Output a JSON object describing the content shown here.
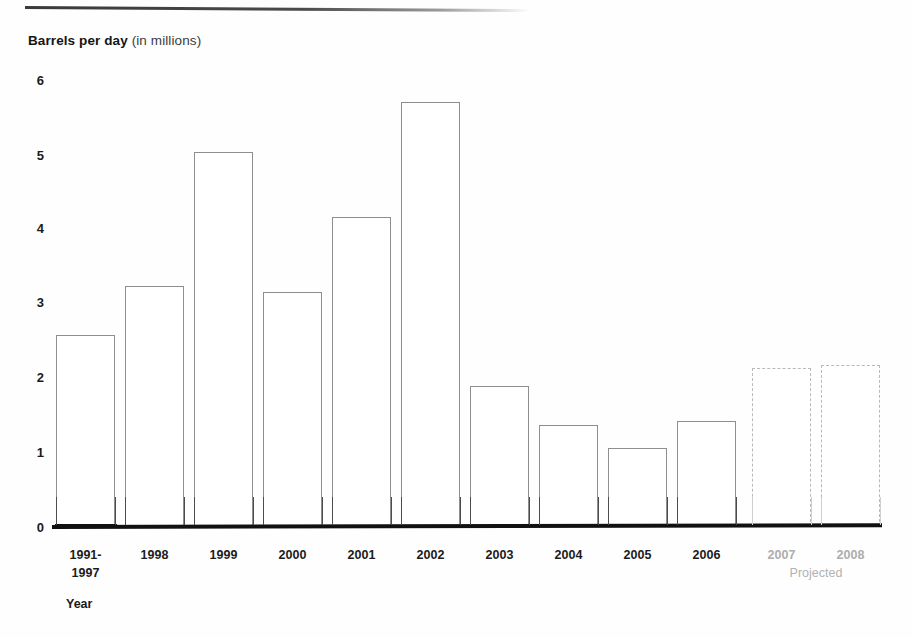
{
  "chart_data": {
    "type": "bar",
    "title": "Barrels per day (in millions)",
    "title_bold_part": "Barrels per day",
    "title_light_part": "(in millions)",
    "xlabel": "Year",
    "ylabel": "Barrels per day (in millions)",
    "ylim": [
      0,
      6
    ],
    "yticks": [
      0,
      1,
      2,
      3,
      4,
      5,
      6
    ],
    "ytick_labels": [
      "0",
      "1",
      "2",
      "3",
      "4",
      "5",
      "6"
    ],
    "grid": false,
    "legend": "none",
    "categories": [
      "1991-\n1997",
      "1998",
      "1999",
      "2000",
      "2001",
      "2002",
      "2003",
      "2004",
      "2005",
      "2006",
      "2007",
      "2008"
    ],
    "values": [
      2.55,
      3.2,
      5.0,
      3.13,
      4.13,
      5.67,
      1.88,
      1.36,
      1.05,
      1.41,
      2.12,
      2.16
    ],
    "projected_flags": [
      false,
      false,
      false,
      false,
      false,
      false,
      false,
      false,
      false,
      false,
      true,
      true
    ],
    "projected_note": "Projected",
    "colors": {
      "bar_outline": "#8e8e8e",
      "bar_fill": "#ffffff",
      "projected_outline": "#b9b9b9",
      "projected_text": "#adadad",
      "axis": "#111111",
      "text": "#1b1b1b"
    }
  },
  "bars": [
    {
      "label": "1991-\n1997",
      "tick_label_line1": "1991-",
      "tick_label_line2": "1997",
      "value": 2.55,
      "projected": false,
      "x": 56,
      "width": 59,
      "top": 335
    },
    {
      "label": "1998",
      "value": 3.2,
      "projected": false,
      "x": 125,
      "width": 59,
      "top": 286
    },
    {
      "label": "1999",
      "value": 5.0,
      "projected": false,
      "x": 194,
      "width": 59,
      "top": 152
    },
    {
      "label": "2000",
      "value": 3.13,
      "projected": false,
      "x": 263,
      "width": 59,
      "top": 292
    },
    {
      "label": "2001",
      "value": 4.13,
      "projected": false,
      "x": 332,
      "width": 59,
      "top": 217
    },
    {
      "label": "2002",
      "value": 5.67,
      "projected": false,
      "x": 401,
      "width": 59,
      "top": 102
    },
    {
      "label": "2003",
      "value": 1.88,
      "projected": false,
      "x": 470,
      "width": 59,
      "top": 386
    },
    {
      "label": "2004",
      "value": 1.36,
      "projected": false,
      "x": 539,
      "width": 59,
      "top": 425
    },
    {
      "label": "2005",
      "value": 1.05,
      "projected": false,
      "x": 608,
      "width": 59,
      "top": 448
    },
    {
      "label": "2006",
      "value": 1.41,
      "projected": false,
      "x": 677,
      "width": 59,
      "top": 421
    },
    {
      "label": "2007",
      "value": 2.12,
      "projected": true,
      "x": 752,
      "width": 59,
      "top": 368
    },
    {
      "label": "2008",
      "value": 2.16,
      "projected": true,
      "x": 821,
      "width": 59,
      "top": 365
    }
  ],
  "axis": {
    "y_labels": [
      {
        "text": "6",
        "y": 80
      },
      {
        "text": "5",
        "y": 155
      },
      {
        "text": "4",
        "y": 228
      },
      {
        "text": "3",
        "y": 302
      },
      {
        "text": "2",
        "y": 377
      },
      {
        "text": "1",
        "y": 452
      },
      {
        "text": "0",
        "y": 527
      }
    ],
    "x_caption": "Year",
    "projected_note": "Projected"
  }
}
